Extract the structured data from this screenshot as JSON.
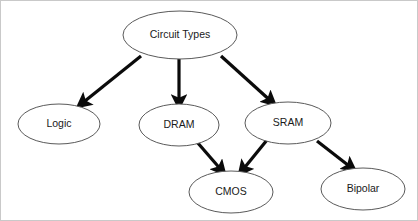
{
  "diagram": {
    "background_color": "#ffffff",
    "node_fill": "#ffffff",
    "node_stroke": "#5a5a5a",
    "edge_color": "#0b0b0b",
    "text_color": "#1a1a1a",
    "nodes": [
      {
        "id": "circuit-types",
        "label": "Circuit Types",
        "cx": 179,
        "cy": 34,
        "rx": 57,
        "ry": 24
      },
      {
        "id": "logic",
        "label": "Logic",
        "cx": 58,
        "cy": 123,
        "rx": 41,
        "ry": 20
      },
      {
        "id": "dram",
        "label": "DRAM",
        "cx": 178,
        "cy": 124,
        "rx": 40,
        "ry": 21
      },
      {
        "id": "sram",
        "label": "SRAM",
        "cx": 287,
        "cy": 122,
        "rx": 43,
        "ry": 21
      },
      {
        "id": "cmos",
        "label": "CMOS",
        "cx": 230,
        "cy": 191,
        "rx": 42,
        "ry": 21
      },
      {
        "id": "bipolar",
        "label": "Bipolar",
        "cx": 362,
        "cy": 188,
        "rx": 42,
        "ry": 21
      }
    ],
    "edges": [
      {
        "id": "circuit-types-to-logic",
        "from": "Circuit Types",
        "to": "Logic",
        "x1": 140,
        "y1": 55,
        "x2": 79,
        "y2": 104
      },
      {
        "id": "circuit-types-to-dram",
        "from": "Circuit Types",
        "to": "DRAM",
        "x1": 178,
        "y1": 58,
        "x2": 178,
        "y2": 104
      },
      {
        "id": "circuit-types-to-sram",
        "from": "Circuit Types",
        "to": "SRAM",
        "x1": 220,
        "y1": 55,
        "x2": 272,
        "y2": 102
      },
      {
        "id": "dram-to-cmos",
        "from": "DRAM",
        "to": "CMOS",
        "x1": 196,
        "y1": 141,
        "x2": 222,
        "y2": 171
      },
      {
        "id": "sram-to-cmos",
        "from": "SRAM",
        "to": "CMOS",
        "x1": 266,
        "y1": 139,
        "x2": 240,
        "y2": 171
      },
      {
        "id": "sram-to-bipolar",
        "from": "SRAM",
        "to": "Bipolar",
        "x1": 316,
        "y1": 140,
        "x2": 352,
        "y2": 168
      }
    ]
  }
}
